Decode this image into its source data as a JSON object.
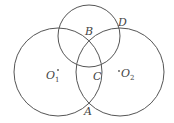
{
  "figure": {
    "circles": [
      {
        "name": "circle-o1",
        "center_label": "O",
        "center_subscript": "1"
      },
      {
        "name": "circle-o2",
        "center_label": "O",
        "center_subscript": "2"
      },
      {
        "name": "circle-top",
        "center_label": ""
      }
    ],
    "points": {
      "A": "A",
      "B": "B",
      "C": "C",
      "D": "D"
    },
    "centers": {
      "o1": {
        "letter": "O",
        "subscript": "1"
      },
      "o2": {
        "letter": "O",
        "subscript": "2"
      }
    },
    "colors": {
      "stroke": "#555555",
      "text": "#444444",
      "background": "#ffffff"
    }
  }
}
